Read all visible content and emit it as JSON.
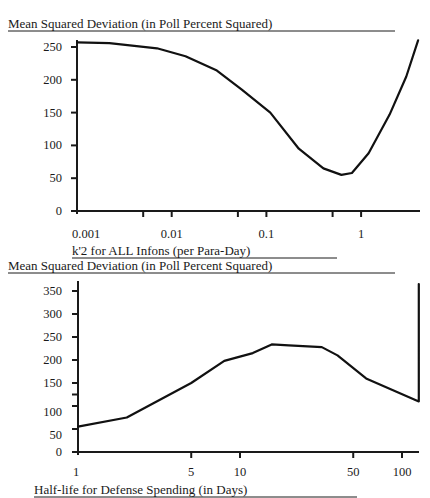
{
  "chart_data": [
    {
      "type": "line",
      "title": "Mean Squared Deviation (in Poll Percent Squared)",
      "xlabel": "k'2 for ALL Infons (per Para-Day)",
      "ylabel": "",
      "xscale": "log",
      "xlim": [
        0.001,
        4.2
      ],
      "ylim": [
        0,
        260
      ],
      "yticks": [
        0,
        50,
        100,
        150,
        200,
        250
      ],
      "ytick_labels": [
        "0",
        "50",
        "100",
        "150",
        "200",
        "250"
      ],
      "xticks": [
        0.001,
        0.005,
        0.01,
        0.05,
        0.1,
        0.5,
        1
      ],
      "xtick_labels": [
        "0.001",
        "",
        "0.01",
        "",
        "0.1",
        "",
        "1"
      ],
      "grid": false,
      "legend": null,
      "series": [
        {
          "name": "MSD",
          "x": [
            0.001,
            0.0022,
            0.007,
            0.014,
            0.03,
            0.055,
            0.11,
            0.22,
            0.4,
            0.62,
            0.8,
            1.2,
            2.0,
            3.0,
            4.0
          ],
          "y": [
            257,
            256,
            248,
            236,
            214,
            185,
            150,
            95,
            65,
            55,
            58,
            88,
            147,
            205,
            260
          ]
        }
      ]
    },
    {
      "type": "line",
      "title": "Mean Squared Deviation (in Poll Percent Squared)",
      "xlabel": "Half-life for Defense Spending (in Days)",
      "ylabel": "",
      "xscale": "log",
      "xlim": [
        1,
        127
      ],
      "ylim": [
        0,
        370
      ],
      "yticks": [
        0,
        50,
        100,
        150,
        200,
        250,
        300,
        350
      ],
      "ytick_labels": [
        "0",
        "50",
        "100",
        "150",
        "200",
        "250",
        "300",
        "350"
      ],
      "xticks": [
        1,
        5,
        10,
        50,
        100
      ],
      "xtick_labels": [
        "1",
        "5",
        "10",
        "50",
        "100"
      ],
      "grid": false,
      "legend": null,
      "series": [
        {
          "name": "MSD",
          "x": [
            1,
            2,
            5,
            8,
            12,
            15.7,
            20,
            32,
            40,
            60,
            127,
            127
          ],
          "y": [
            55,
            75,
            150,
            198,
            215,
            234,
            232,
            228,
            210,
            160,
            110,
            365
          ]
        }
      ]
    }
  ],
  "charts": [
    {
      "title": "Mean Squared Deviation (in Poll Percent Squared)",
      "xlabel": "k'2 for ALL Infons (per Para-Day)"
    },
    {
      "title": "Mean Squared Deviation (in Poll Percent Squared)",
      "xlabel": "Half-life for Defense Spending (in Days)"
    }
  ]
}
